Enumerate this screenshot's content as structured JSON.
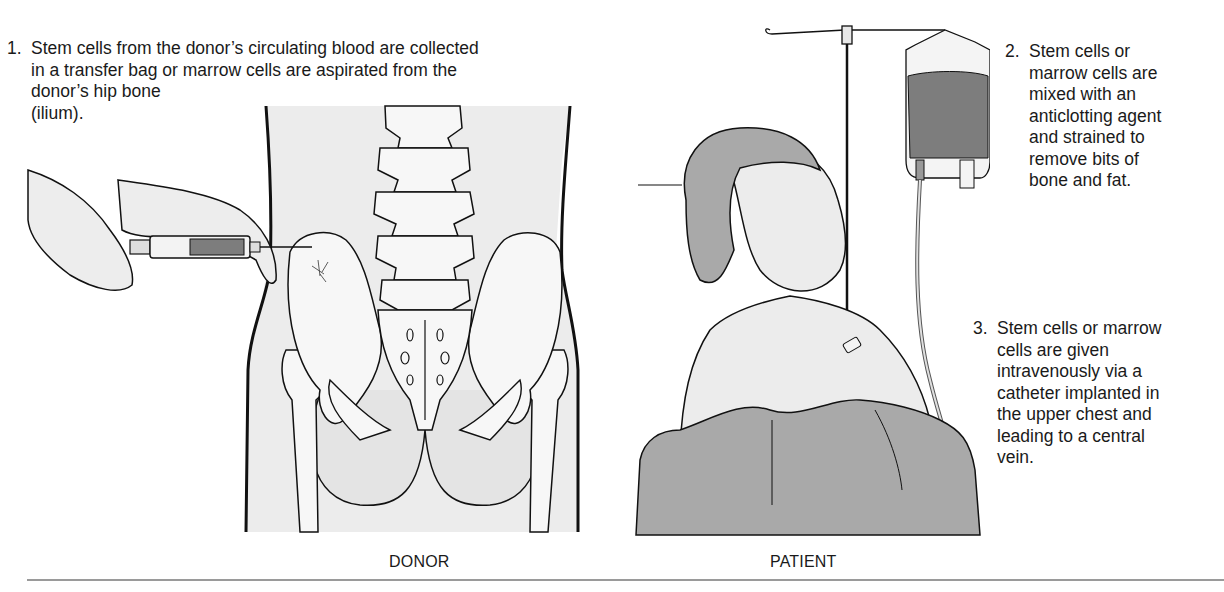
{
  "figure": {
    "steps": [
      {
        "number": "1.",
        "lines": [
          "Stem cells from the donor’s circulating blood are collected",
          "in a transfer bag or marrow cells are aspirated from the",
          "donor’s hip bone",
          "(ilium)."
        ]
      },
      {
        "number": "2.",
        "lines": [
          "Stem cells or",
          "marrow cells are",
          "mixed with an",
          "anticlotting agent",
          "and strained to",
          "remove bits of",
          "bone and fat."
        ]
      },
      {
        "number": "3.",
        "lines": [
          "Stem cells or marrow",
          "cells are given",
          "intravenously via a",
          "catheter implanted in",
          "the upper chest and",
          "leading to a central",
          "vein."
        ]
      }
    ],
    "captions": {
      "donor": "DONOR",
      "patient": "PATIENT"
    },
    "illustrations": {
      "donor": "donor-pelvis-marrow-aspiration",
      "patient": "patient-iv-infusion"
    },
    "colors": {
      "skin_fill": "#ececec",
      "bone_fill": "#f7f7f7",
      "line": "#111111",
      "dark_fill": "#7d7d7d",
      "mid_fill": "#a9a9a9",
      "divider": "#9a9a9a"
    }
  }
}
